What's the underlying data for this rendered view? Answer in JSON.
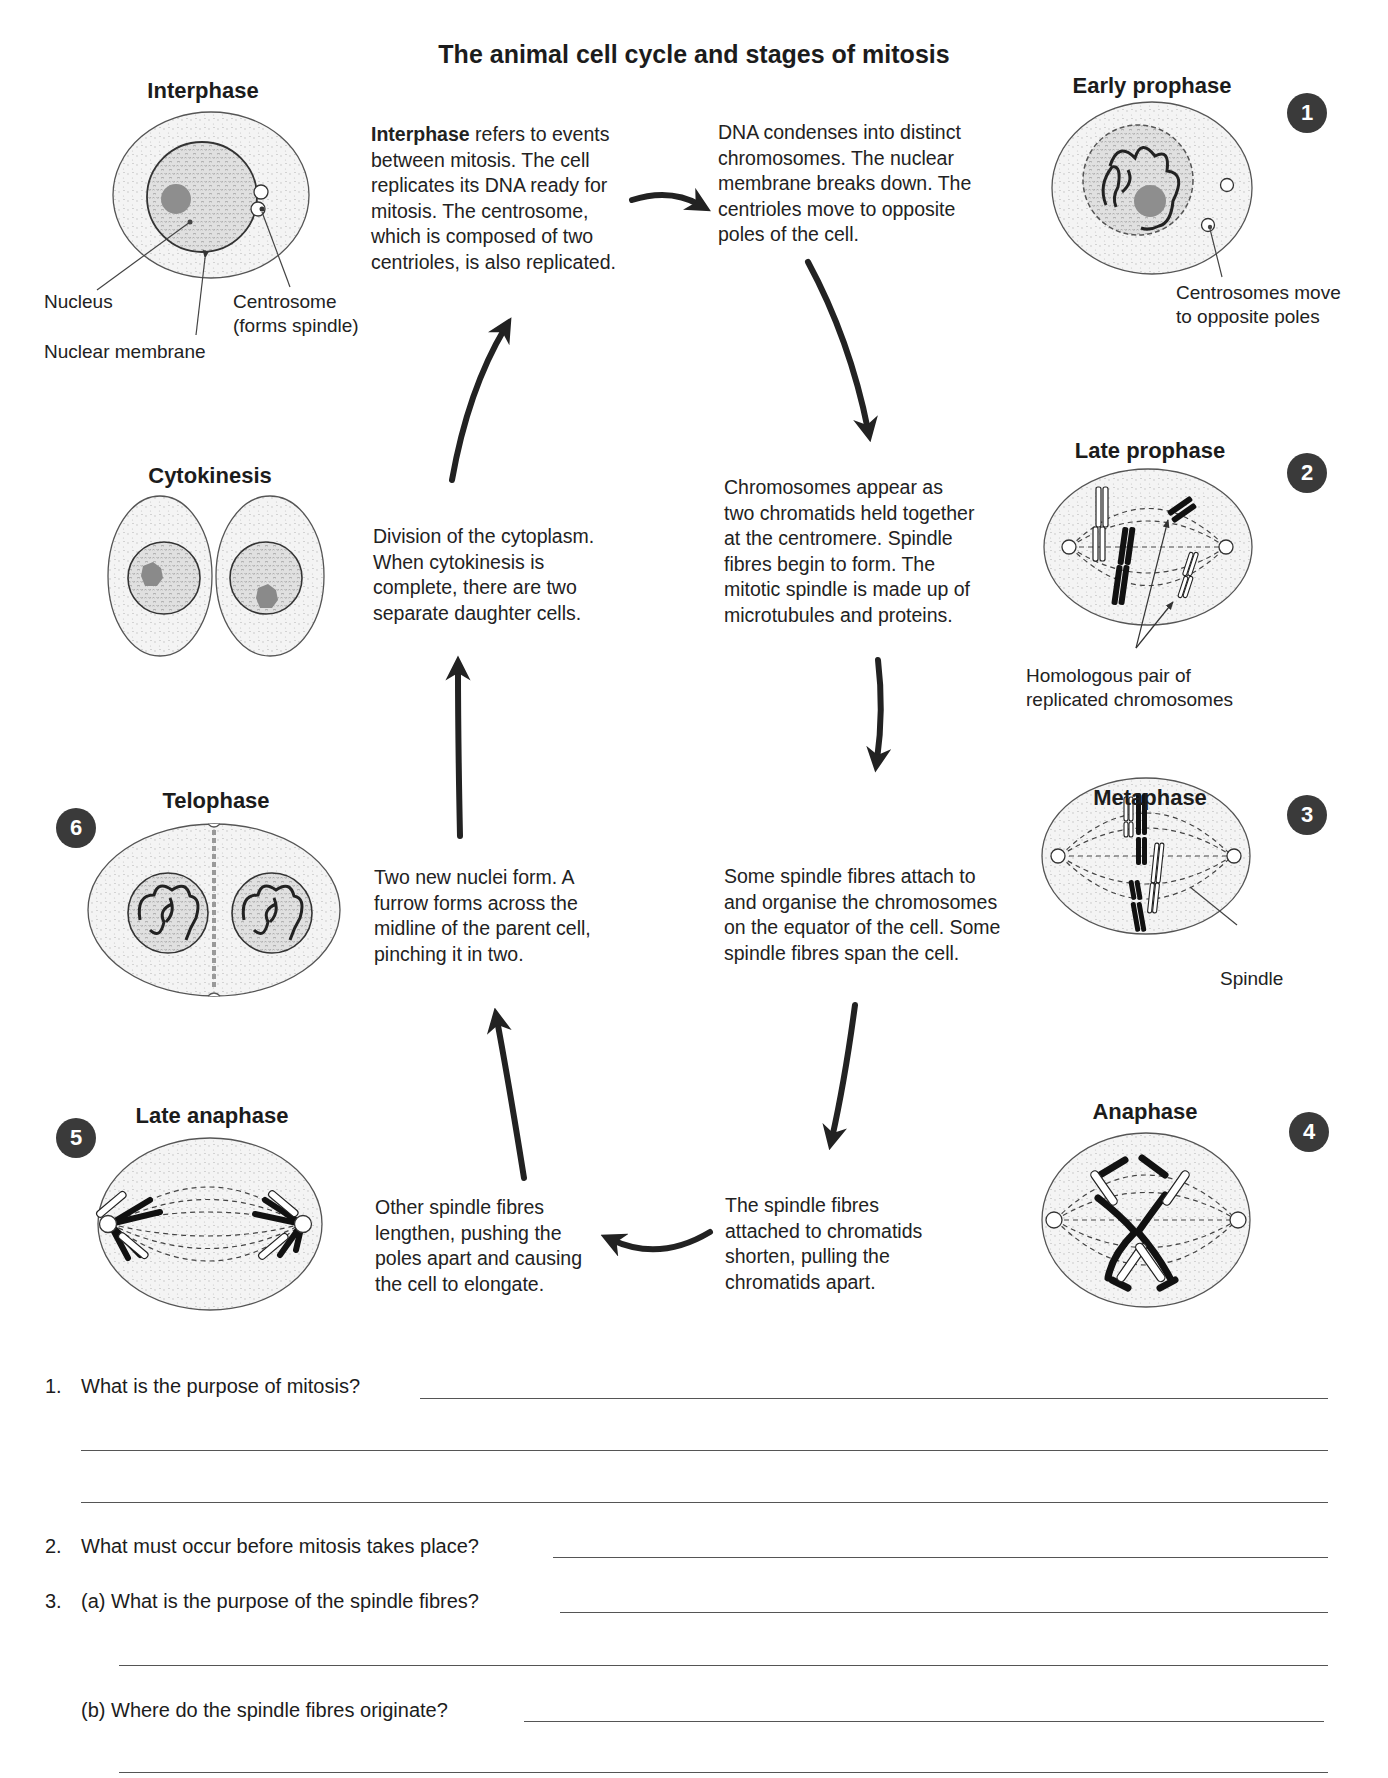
{
  "title": "The animal cell cycle and stages of mitosis",
  "stages": {
    "interphase": {
      "label": "Interphase",
      "description_bold": "Interphase",
      "description": " refers to events\nbetween mitosis. The cell\nreplicates its DNA ready for\nmitosis. The centrosome,\nwhich is composed of two\ncentrioles, is also replicated.",
      "callouts": {
        "nucleus": "Nucleus",
        "nuclear_membrane": "Nuclear membrane",
        "centrosome": "Centrosome\n(forms spindle)"
      }
    },
    "early_prophase": {
      "number": "1",
      "label": "Early prophase",
      "description": "DNA condenses into distinct\nchromosomes. The nuclear\nmembrane breaks down. The\ncentrioles move to opposite\npoles of the cell.",
      "callout": "Centrosomes move\nto opposite poles"
    },
    "late_prophase": {
      "number": "2",
      "label": "Late prophase",
      "description": "Chromosomes appear as\ntwo chromatids held together\nat the centromere. Spindle\nfibres begin to form. The\nmitotic spindle is made up of\nmicrotubules and proteins.",
      "callout": "Homologous pair of\nreplicated chromosomes"
    },
    "metaphase": {
      "number": "3",
      "label": "Metaphase",
      "description": "Some spindle fibres attach to\nand organise the chromosomes\non the equator of the cell. Some\nspindle fibres span the cell.",
      "callout": "Spindle"
    },
    "anaphase": {
      "number": "4",
      "label": "Anaphase",
      "description": "The spindle fibres\nattached to chromatids\nshorten, pulling the\nchromatids apart."
    },
    "late_anaphase": {
      "number": "5",
      "label": "Late anaphase",
      "description": "Other spindle fibres\nlengthen, pushing the\npoles apart and causing\nthe cell to elongate."
    },
    "telophase": {
      "number": "6",
      "label": "Telophase",
      "description": "Two new nuclei form. A\nfurrow forms across the\nmidline of the parent cell,\npinching it in two."
    },
    "cytokinesis": {
      "label": "Cytokinesis",
      "description": "Division of the cytoplasm.\nWhen cytokinesis is\ncomplete, there are two\nseparate daughter cells."
    }
  },
  "questions": [
    {
      "number": "1.",
      "text": "What is the purpose of mitosis?"
    },
    {
      "number": "2.",
      "text": "What must occur before mitosis takes place?"
    },
    {
      "number": "3.",
      "text": "(a) What is the purpose of the spindle fibres?"
    },
    {
      "number": "",
      "text": "(b) Where do the spindle fibres originate?"
    }
  ],
  "colors": {
    "badge": "#3a3a3a",
    "arrow": "#222222",
    "cell_fill": "#f1f1f1",
    "nucleus_fill": "#d6d6d6",
    "nucleolus": "#8a8a8a"
  }
}
